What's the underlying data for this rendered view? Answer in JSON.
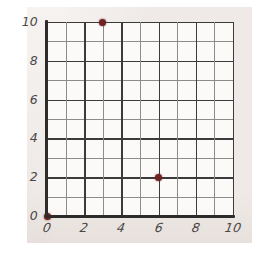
{
  "figure": {
    "title": "",
    "paper_color": "#efeae7",
    "plot_background": "#fbfaf9",
    "axis_color": "#2e2c2b",
    "grid_major_color": "#3b3b3b",
    "grid_minor_color": "#8e8c8a",
    "point_color": "#6e2222"
  },
  "chart_data": {
    "type": "scatter",
    "title": "",
    "xlabel": "",
    "ylabel": "",
    "xlim": [
      0,
      10
    ],
    "ylim": [
      0,
      10
    ],
    "grid": true,
    "grid_step": 1,
    "legend": "none",
    "xticks": [
      0,
      2,
      4,
      6,
      8,
      10
    ],
    "yticks": [
      0,
      2,
      4,
      6,
      8,
      10
    ],
    "xtick_labels": [
      "0",
      "2",
      "4",
      "6",
      "8",
      "10"
    ],
    "ytick_labels": [
      "0",
      "2",
      "4",
      "6",
      "8",
      "10"
    ],
    "points": [
      {
        "label": "(0, 0)",
        "x": 0,
        "y": 0
      },
      {
        "label": "(3, 10)",
        "x": 3,
        "y": 10
      },
      {
        "label": "(6, 2)",
        "x": 6,
        "y": 2
      }
    ],
    "series": [
      {
        "name": "plotted points",
        "x": [
          0,
          3,
          6
        ],
        "y": [
          0,
          10,
          2
        ],
        "marker": "circle",
        "color": "#6e2222"
      }
    ]
  }
}
